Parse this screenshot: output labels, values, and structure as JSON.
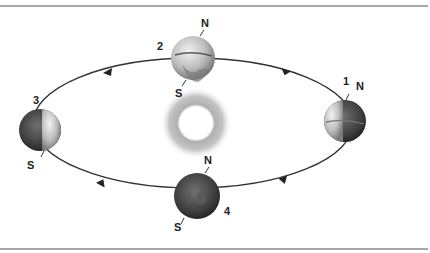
{
  "diagram": {
    "type": "earth-orbit-seasons",
    "center": "sun",
    "orbit_direction": "counterclockwise",
    "positions": [
      {
        "number": "1",
        "north_label": "N",
        "south_label": "",
        "lit_side": "left"
      },
      {
        "number": "2",
        "north_label": "N",
        "south_label": "S",
        "lit_side": "full"
      },
      {
        "number": "3",
        "north_label": "",
        "south_label": "S",
        "lit_side": "right"
      },
      {
        "number": "4",
        "north_label": "N",
        "south_label": "S",
        "lit_side": "none"
      }
    ]
  },
  "colors": {
    "rule": "#a8a8a8",
    "orbit": "#333333",
    "sun_glow": "#b5b5b5",
    "earth_dark": "#3a3a3a",
    "earth_light": "#d8d8d8"
  }
}
